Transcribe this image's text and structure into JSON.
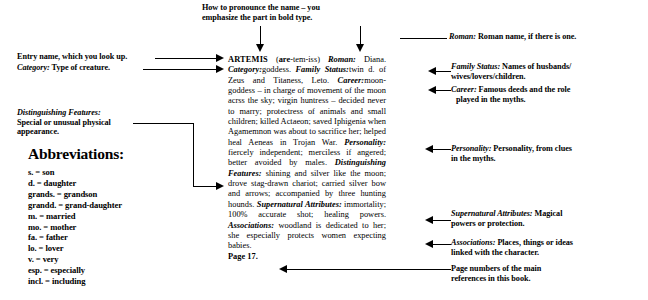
{
  "top_annotation": {
    "name": "pronunciation-note",
    "line1": "How to pronounce the name – you",
    "line2": "emphasize the part in bold type."
  },
  "left_annotations": [
    {
      "name": "entry-name-note",
      "text": "Entry name, which you look up."
    },
    {
      "name": "category-note",
      "italic": "Category:",
      "text": " Type of creature."
    },
    {
      "name": "distinguishing-features-note",
      "italic": "Distinguishing Features:",
      "line2": "Special or unusual physical",
      "line3": "appearance."
    }
  ],
  "abbreviations": {
    "heading": "Abbreviations:",
    "items": [
      "s.  =  son",
      "d.  =  daughter",
      "grands.  =  grandson",
      "grandd.  =  grand-daughter",
      "m.  =  married",
      "mo.  =  mother",
      "fa.  =  father",
      "lo.  =  lover",
      "v.  =  very",
      "esp.  =  especially",
      "incl.  =  including"
    ]
  },
  "right_annotations": [
    {
      "name": "roman-note",
      "italic": "Roman:",
      "line1": " Roman name, if there is one."
    },
    {
      "name": "family-status-note",
      "italic": "Family Status:",
      "line1": " Names of husbands/",
      "line2": "wives/lovers/children."
    },
    {
      "name": "career-note",
      "italic": "Career:",
      "line1": " Famous deeds and the role",
      "line2": "played in the myths."
    },
    {
      "name": "personality-note",
      "italic": "Personality:",
      "line1": " Personality, from clues",
      "line2": "in the myths."
    },
    {
      "name": "supernatural-attributes-note",
      "italic": "Supernatural Attributes:",
      "line1": " Magical",
      "line2": "powers or protection."
    },
    {
      "name": "associations-note",
      "italic": "Associations:",
      "line1": " Places, things or ideas",
      "line2": "linked with the character."
    },
    {
      "name": "page-numbers-note",
      "line1": "Page numbers of the main",
      "line2": "references in this book."
    }
  ],
  "entry": {
    "name": "ARTEMIS",
    "pronunciation_prefix": "(",
    "pronunciation_bold": "are",
    "pronunciation_rest": "-tem-iss)",
    "fields": [
      {
        "label": "Roman:",
        "value": " Diana. "
      },
      {
        "label": "Category:",
        "value": "goddess. "
      },
      {
        "label": "Family Status:",
        "value": "twin d. of Zeus and Titaness, Leto. "
      },
      {
        "label": "Career:",
        "value": "moon-goddess – in charge of movement of the moon acrss the sky; virgin huntress – decided never to marry; protectress of animals and small children; killed Actaeon; saved Iphigenia when Agamemnon was about to sacrifice her; helped heal Aeneas in Trojan War. "
      },
      {
        "label": "Personality:",
        "value": " fiercely independent; merciless if angered; better avoided by males. "
      },
      {
        "label": "Distinguishing Features:",
        "value": " shining and silver like the moon; drove stag-drawn chariot; carried silver bow and arrows; accompanied by three hunting hounds. "
      },
      {
        "label": "Supernatural Attributes:",
        "value": " immortality; 100% accurate shot; healing powers. "
      },
      {
        "label": "Associations:",
        "value": " woodland is dedicated to her; she especially protects women expecting babies. "
      }
    ],
    "page_reference": "Page 17."
  }
}
